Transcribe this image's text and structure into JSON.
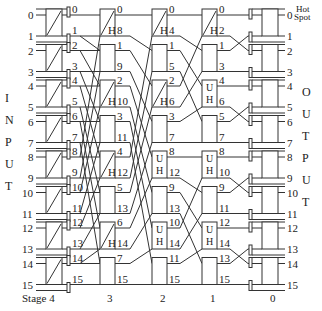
{
  "side_labels": {
    "input": [
      "I",
      "N",
      "P",
      "U",
      "T"
    ],
    "output": [
      "O",
      "U",
      "T",
      "P",
      "U",
      "T"
    ]
  },
  "hot_spot_label": [
    "Hot",
    "Spot"
  ],
  "stage_labels": [
    "Stage  4",
    "3",
    "2",
    "1",
    "0"
  ],
  "stage_x": [
    54,
    107,
    160,
    210,
    270
  ],
  "inputs": [
    "0",
    "1",
    "2",
    "3",
    "4",
    "5",
    "6",
    "7",
    "8",
    "9",
    "10",
    "11",
    "12",
    "13",
    "14",
    "15"
  ],
  "stage4_out": [
    "0",
    "1",
    "2",
    "3",
    "4",
    "5",
    "6",
    "7",
    "8",
    "9",
    "10",
    "11",
    "12",
    "13",
    "14",
    "15"
  ],
  "stage3_out": [
    "0",
    "8",
    "1",
    "9",
    "2",
    "10",
    "3",
    "11",
    "4",
    "12",
    "5",
    "13",
    "6",
    "14",
    "7",
    "15"
  ],
  "stage2_out": [
    "0",
    "4",
    "1",
    "5",
    "2",
    "6",
    "3",
    "7",
    "8",
    "12",
    "9",
    "13",
    "10",
    "14",
    "11",
    "15"
  ],
  "stage1_out": [
    "0",
    "2",
    "1",
    "3",
    "4",
    "6",
    "5",
    "7",
    "8",
    "10",
    "9",
    "11",
    "12",
    "14",
    "13",
    "15"
  ],
  "outputs": [
    "0",
    "1",
    "2",
    "3",
    "4",
    "5",
    "6",
    "7",
    "8",
    "9",
    "10",
    "11",
    "12",
    "13",
    "14",
    "15"
  ],
  "box_marks": {
    "stage4": [
      "diag",
      "diag",
      "diag",
      "diag",
      "diag",
      "diag",
      "diag",
      "diag"
    ],
    "stage3": [
      "diagH",
      "plain",
      "diagH",
      "plain",
      "diagH",
      "plain",
      "diagH",
      "plain"
    ],
    "stage2": [
      "diagH",
      "plain",
      "diagH",
      "plain",
      "UH",
      "plain",
      "UH",
      "plain"
    ],
    "stage1": [
      "diagH",
      "plain",
      "UH",
      "plain",
      "UH",
      "plain",
      "UH",
      "plain"
    ],
    "stage0": [
      "plain",
      "plain",
      "plain",
      "plain",
      "plain",
      "plain",
      "plain",
      "plain"
    ]
  }
}
